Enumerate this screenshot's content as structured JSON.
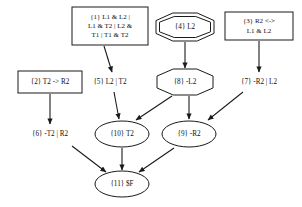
{
  "diagram": {
    "background_color": "#ffffff",
    "stroke_color": "#1a1a1a",
    "nodes": [
      {
        "id": "n1",
        "label_lines": [
          "{1} L1 & L2 |",
          "L1 & T2 | L2 &",
          "T1 | T1 & T2"
        ],
        "text": "{1} L1 & L2 | L1 & T2 | L2 & T1 | T1 & T2",
        "shape": "box",
        "cx": 110,
        "cy": 26,
        "w": 76,
        "h": 38
      },
      {
        "id": "n4",
        "label_lines": [
          "{4} L2"
        ],
        "text": "{4} L2",
        "shape": "doubleoctagon",
        "cx": 185,
        "cy": 27,
        "w": 58,
        "h": 28
      },
      {
        "id": "n3",
        "label_lines": [
          "{3} R2 <->",
          "L1 & L2"
        ],
        "text": "{3} R2 <-> L1 & L2",
        "shape": "box",
        "cx": 259,
        "cy": 26,
        "w": 68,
        "h": 28
      },
      {
        "id": "n2",
        "label_lines": [
          "{2} T2 -> R2"
        ],
        "text": "{2} T2 -> R2",
        "shape": "box",
        "cx": 50,
        "cy": 82,
        "w": 64,
        "h": 22
      },
      {
        "id": "n5",
        "label_lines": [
          "{5} L2 | T2"
        ],
        "text": "{5} L2 | T2",
        "shape": "plaintext",
        "cx": 110,
        "cy": 82,
        "w": 50,
        "h": 16
      },
      {
        "id": "n8",
        "label_lines": [
          "{8} -L2"
        ],
        "text": "{8} -L2",
        "shape": "octagon",
        "cx": 185,
        "cy": 82,
        "w": 56,
        "h": 26
      },
      {
        "id": "n7",
        "label_lines": [
          "{7} -R2 | L2"
        ],
        "text": "{7} -R2 | L2",
        "shape": "plaintext",
        "cx": 259,
        "cy": 82,
        "w": 54,
        "h": 16
      },
      {
        "id": "n6",
        "label_lines": [
          "{6} -T2 | R2"
        ],
        "text": "{6} -T2 | R2",
        "shape": "plaintext",
        "cx": 50,
        "cy": 134,
        "w": 54,
        "h": 16
      },
      {
        "id": "n10",
        "label_lines": [
          "{10} T2"
        ],
        "text": "{10} T2",
        "shape": "ellipse",
        "cx": 122,
        "cy": 134,
        "w": 54,
        "h": 26
      },
      {
        "id": "n9",
        "label_lines": [
          "{9} -R2"
        ],
        "text": "{9} -R2",
        "shape": "ellipse",
        "cx": 189,
        "cy": 134,
        "w": 54,
        "h": 26
      },
      {
        "id": "n11",
        "label_lines": [
          "{11} $F"
        ],
        "text": "{11} $F",
        "shape": "ellipse",
        "cx": 122,
        "cy": 184,
        "w": 54,
        "h": 26
      }
    ],
    "edges": [
      {
        "from": "n1",
        "to": "n5",
        "x1": 104,
        "y1": 46,
        "x2": 112,
        "y2": 72
      },
      {
        "from": "n4",
        "to": "n8",
        "x1": 185,
        "y1": 42,
        "x2": 185,
        "y2": 68
      },
      {
        "from": "n3",
        "to": "n7",
        "x1": 259,
        "y1": 41,
        "x2": 259,
        "y2": 72
      },
      {
        "from": "n2",
        "to": "n6",
        "x1": 50,
        "y1": 94,
        "x2": 50,
        "y2": 124
      },
      {
        "from": "n5",
        "to": "n10",
        "x1": 114,
        "y1": 92,
        "x2": 119,
        "y2": 119
      },
      {
        "from": "n8",
        "to": "n10",
        "x1": 172,
        "y1": 96,
        "x2": 136,
        "y2": 120
      },
      {
        "from": "n8",
        "to": "n9",
        "x1": 189,
        "y1": 96,
        "x2": 189,
        "y2": 119
      },
      {
        "from": "n7",
        "to": "n9",
        "x1": 243,
        "y1": 92,
        "x2": 208,
        "y2": 120
      },
      {
        "from": "n6",
        "to": "n11",
        "x1": 72,
        "y1": 146,
        "x2": 106,
        "y2": 172
      },
      {
        "from": "n10",
        "to": "n11",
        "x1": 122,
        "y1": 148,
        "x2": 122,
        "y2": 170
      },
      {
        "from": "n9",
        "to": "n11",
        "x1": 174,
        "y1": 148,
        "x2": 139,
        "y2": 172
      }
    ]
  }
}
